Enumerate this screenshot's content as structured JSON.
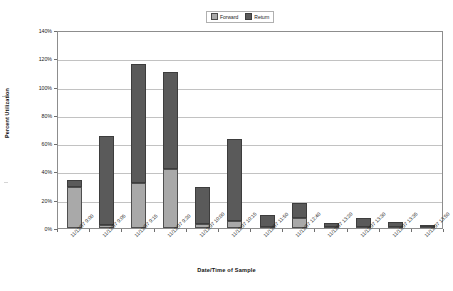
{
  "chart_data": {
    "type": "bar",
    "stacked": true,
    "title": "",
    "xlabel": "Date/Time of Sample",
    "ylabel": "Percent Utilization",
    "ylim": [
      0,
      140
    ],
    "ytick_step": 20,
    "ytick_labels": [
      "0%",
      "20%",
      "40%",
      "60%",
      "80%",
      "100%",
      "120%",
      "140%"
    ],
    "ytick_values": [
      0,
      20,
      40,
      60,
      80,
      100,
      120,
      140
    ],
    "grid": true,
    "legend_position": "top-center",
    "categories": [
      "11/12/97 9:00",
      "11/12/97 9:05",
      "11/12/97 9:15",
      "11/12/97 9:20",
      "11/12/97 10:00",
      "11/12/97 10:15",
      "11/12/97 11:50",
      "11/12/97 12:40",
      "11/12/97 13:20",
      "11/12/97 13:30",
      "11/12/97 13:35",
      "11/12/97 13:50"
    ],
    "series": [
      {
        "name": "Forward",
        "color": "#a9a9a9",
        "values": [
          29,
          2,
          32,
          42,
          3,
          5,
          0.5,
          7,
          0.5,
          0.5,
          0.5,
          0.5
        ]
      },
      {
        "name": "Return",
        "color": "#5a5a5a",
        "values": [
          5,
          63,
          84,
          68,
          26,
          58,
          8.5,
          11,
          3,
          6.5,
          4,
          1.5
        ]
      }
    ],
    "totals": [
      34,
      65,
      116,
      110,
      29,
      63,
      9,
      18,
      3.5,
      7,
      4.5,
      2
    ]
  },
  "legend": {
    "entries": [
      {
        "label": "Forward"
      },
      {
        "label": "Return"
      }
    ]
  },
  "axes": {
    "y_title": "Percent Utilization",
    "x_title": "Date/Time of Sample"
  }
}
